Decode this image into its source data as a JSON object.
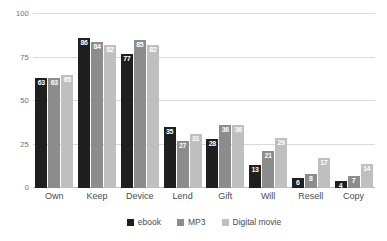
{
  "chart_data": {
    "type": "bar",
    "title": "",
    "subtitle": "",
    "xlabel": "",
    "ylabel": "",
    "ylim": [
      0,
      100
    ],
    "yticks": [
      0,
      25,
      50,
      75,
      100
    ],
    "grid": true,
    "legend_position": "bottom",
    "categories": [
      "Own",
      "Keep",
      "Device",
      "Lend",
      "Gift",
      "Will",
      "Resell",
      "Copy"
    ],
    "series": [
      {
        "name": "ebook",
        "color": "#1f1f1f",
        "values": [
          63,
          86,
          77,
          35,
          28,
          13,
          6,
          4
        ]
      },
      {
        "name": "MP3",
        "color": "#8c8c8c",
        "values": [
          63,
          84,
          85,
          27,
          36,
          21,
          8,
          7
        ]
      },
      {
        "name": "Digital movie",
        "color": "#bfbfbf",
        "values": [
          65,
          82,
          82,
          31,
          36,
          29,
          17,
          14
        ]
      }
    ]
  }
}
